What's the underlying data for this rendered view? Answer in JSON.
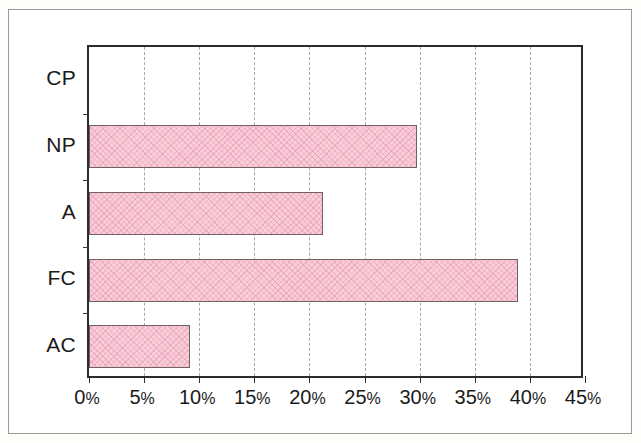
{
  "chart_data": {
    "type": "bar",
    "orientation": "horizontal",
    "title": "",
    "subtitle": "",
    "xlabel": "",
    "ylabel": "",
    "categories": [
      "CP",
      "NP",
      "A",
      "FC",
      "AC"
    ],
    "values": [
      0,
      29.8,
      21.2,
      38.9,
      9.2
    ],
    "value_unit": "%",
    "series": [
      {
        "name": "",
        "values": [
          0,
          29.8,
          21.2,
          38.9,
          9.2
        ]
      }
    ],
    "category_order_top_to_bottom": [
      "CP",
      "NP",
      "A",
      "FC",
      "AC"
    ],
    "xlim": [
      0,
      45
    ],
    "xticks": [
      0,
      5,
      10,
      15,
      20,
      25,
      30,
      35,
      40,
      45
    ],
    "xtick_labels": [
      "0%",
      "5%",
      "10%",
      "15%",
      "20%",
      "25%",
      "30%",
      "35%",
      "40%",
      "45%"
    ],
    "grid": "vertical-dashed",
    "legend": "none",
    "legend_position": "none",
    "annotations": [],
    "bar_fill_color": "#f9cdd9",
    "bar_edge_color": "#6f625f",
    "bar_pattern": "crosshatch",
    "gridline_color": "#a8a8a4",
    "axis_color": "#2b2b2b",
    "background_color": "#ffffff"
  },
  "axis": {
    "x_ticks": [
      {
        "label": "0",
        "suffix": "%",
        "value": 0
      },
      {
        "label": "5",
        "suffix": "%",
        "value": 5
      },
      {
        "label": "10",
        "suffix": "%",
        "value": 10
      },
      {
        "label": "15",
        "suffix": "%",
        "value": 15
      },
      {
        "label": "20",
        "suffix": "%",
        "value": 20
      },
      {
        "label": "25",
        "suffix": "%",
        "value": 25
      },
      {
        "label": "30",
        "suffix": "%",
        "value": 30
      },
      {
        "label": "35",
        "suffix": "%",
        "value": 35
      },
      {
        "label": "40",
        "suffix": "%",
        "value": 40
      },
      {
        "label": "45",
        "suffix": "%",
        "value": 45
      }
    ],
    "y_categories": [
      {
        "label": "CP"
      },
      {
        "label": "NP"
      },
      {
        "label": "A"
      },
      {
        "label": "FC"
      },
      {
        "label": "AC"
      }
    ]
  }
}
